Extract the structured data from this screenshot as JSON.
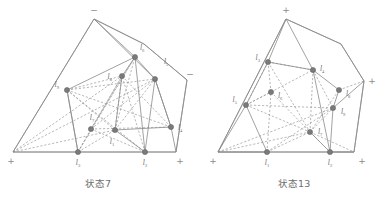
{
  "figure": {
    "panels": [
      {
        "id": "state-7",
        "caption": "状态7",
        "outline_points": "94,19 13,152 176,152 187,80 144,44",
        "corner_markers": [
          {
            "name": "apex",
            "sign": "−",
            "x": 94,
            "y": 13
          },
          {
            "name": "right",
            "sign": "−",
            "x": 190,
            "y": 77
          },
          {
            "name": "bottom-left",
            "sign": "+",
            "x": 11,
            "y": 164
          },
          {
            "name": "bottom-right",
            "sign": "+",
            "x": 180,
            "y": 164
          }
        ],
        "nodes": [
          {
            "id": "l1",
            "label": "l",
            "sub": "1",
            "x": 115,
            "y": 130,
            "lx": 112,
            "ly": 144,
            "anchor": "middle"
          },
          {
            "id": "l2",
            "label": "l",
            "sub": "2",
            "x": 145,
            "y": 152,
            "lx": 145,
            "ly": 165,
            "anchor": "middle"
          },
          {
            "id": "l3",
            "label": "l",
            "sub": "3",
            "x": 78,
            "y": 152,
            "lx": 78,
            "ly": 165,
            "anchor": "middle"
          },
          {
            "id": "l4",
            "label": "l",
            "sub": "4",
            "x": 171,
            "y": 127,
            "lx": 178,
            "ly": 130,
            "anchor": "start"
          },
          {
            "id": "l5",
            "label": "l",
            "sub": "5",
            "x": 155,
            "y": 79,
            "lx": 164,
            "ly": 64,
            "anchor": "start"
          },
          {
            "id": "l6",
            "label": "l",
            "sub": "6",
            "x": 135,
            "y": 57,
            "lx": 140,
            "ly": 50,
            "anchor": "start"
          },
          {
            "id": "l7",
            "label": "l",
            "sub": "7",
            "x": 91,
            "y": 129,
            "lx": 92,
            "ly": 120,
            "anchor": "middle"
          },
          {
            "id": "l8",
            "label": "l",
            "sub": "8",
            "x": 122,
            "y": 76,
            "lx": 112,
            "ly": 79,
            "anchor": "end"
          },
          {
            "id": "l9",
            "label": "l",
            "sub": "9",
            "x": 67,
            "y": 90,
            "lx": 59,
            "ly": 87,
            "anchor": "end"
          }
        ],
        "solid_edges": [
          "94,19 13,152",
          "94,19 144,44",
          "144,44 187,80",
          "187,80 176,152",
          "176,152 13,152",
          "94,19 135,57",
          "94,19 155,79",
          "67,90 135,57",
          "67,90 78,152",
          "135,57 155,79",
          "155,79 171,127",
          "171,127 176,152",
          "135,57 122,76",
          "122,76 115,130",
          "115,130 145,152",
          "155,79 145,152",
          "135,57 145,152",
          "78,152 67,90",
          "171,127 155,79",
          "115,130 171,127"
        ],
        "dashed_edges": [
          "67,90 155,79",
          "67,90 115,130",
          "67,90 145,152",
          "67,90 122,76",
          "91,129 135,57",
          "91,129 155,79",
          "91,129 171,127",
          "91,129 122,76",
          "91,129 145,152",
          "13,152 122,76",
          "13,152 115,130",
          "13,152 155,79",
          "78,152 122,76",
          "78,152 115,130",
          "78,152 135,57",
          "115,130 135,57",
          "115,130 155,79",
          "115,130 122,76",
          "145,152 122,76",
          "122,76 171,127",
          "67,90 171,127",
          "91,129 78,152"
        ]
      },
      {
        "id": "state-13",
        "caption": "状态13",
        "outline_points": "90,19 22,152 158,152 168,81 145,44",
        "corner_markers": [
          {
            "name": "apex",
            "sign": "+",
            "x": 90,
            "y": 13
          },
          {
            "name": "right",
            "sign": "+",
            "x": 176,
            "y": 84
          },
          {
            "name": "bottom-left",
            "sign": "+",
            "x": 17,
            "y": 164
          },
          {
            "name": "bottom-right",
            "sign": "+",
            "x": 166,
            "y": 164
          }
        ],
        "nodes": [
          {
            "id": "l1",
            "label": "l",
            "sub": "1",
            "x": 71,
            "y": 152,
            "lx": 71,
            "ly": 165,
            "anchor": "middle"
          },
          {
            "id": "l2",
            "label": "l",
            "sub": "2",
            "x": 134,
            "y": 152,
            "lx": 134,
            "ly": 165,
            "anchor": "middle"
          },
          {
            "id": "l3",
            "label": "l",
            "sub": "3",
            "x": 72,
            "y": 62,
            "lx": 64,
            "ly": 60,
            "anchor": "end"
          },
          {
            "id": "l4",
            "label": "l",
            "sub": "4",
            "x": 117,
            "y": 70,
            "lx": 124,
            "ly": 71,
            "anchor": "start"
          },
          {
            "id": "l5",
            "label": "l",
            "sub": "5",
            "x": 50,
            "y": 105,
            "lx": 41,
            "ly": 102,
            "anchor": "end"
          },
          {
            "id": "l6",
            "label": "l",
            "sub": "6",
            "x": 75,
            "y": 92,
            "lx": 82,
            "ly": 98,
            "anchor": "start"
          },
          {
            "id": "l7",
            "label": "l",
            "sub": "7",
            "x": 114,
            "y": 132,
            "lx": 122,
            "ly": 134,
            "anchor": "start"
          },
          {
            "id": "l8",
            "label": "l",
            "sub": "8",
            "x": 143,
            "y": 90,
            "lx": 150,
            "ly": 96,
            "anchor": "start"
          },
          {
            "id": "l9",
            "label": "l",
            "sub": "9",
            "x": 137,
            "y": 108,
            "lx": 145,
            "ly": 114,
            "anchor": "start"
          }
        ],
        "solid_edges": [
          "90,19 22,152",
          "90,19 145,44",
          "145,44 168,81",
          "168,81 158,152",
          "158,152 22,152",
          "90,19 72,62",
          "90,19 117,70",
          "72,62 50,105",
          "50,105 22,152",
          "50,105 71,152",
          "117,70 134,152",
          "134,152 158,152",
          "143,90 137,108",
          "137,108 134,152",
          "168,81 137,108",
          "72,62 117,70",
          "117,70 143,90",
          "134,152 114,132",
          "22,152 71,152"
        ],
        "dashed_edges": [
          "72,62 117,70",
          "72,62 75,92",
          "72,62 114,132",
          "72,62 50,105",
          "117,70 114,132",
          "75,92 114,132",
          "50,105 114,132",
          "50,105 75,92",
          "50,105 137,108",
          "22,152 114,132",
          "71,152 114,132",
          "71,152 75,92",
          "114,132 143,90",
          "114,132 137,108",
          "114,132 134,152",
          "114,132 158,152",
          "117,70 137,108",
          "143,90 168,81",
          "50,105 117,70",
          "71,152 137,108",
          "22,152 137,108"
        ]
      }
    ]
  }
}
